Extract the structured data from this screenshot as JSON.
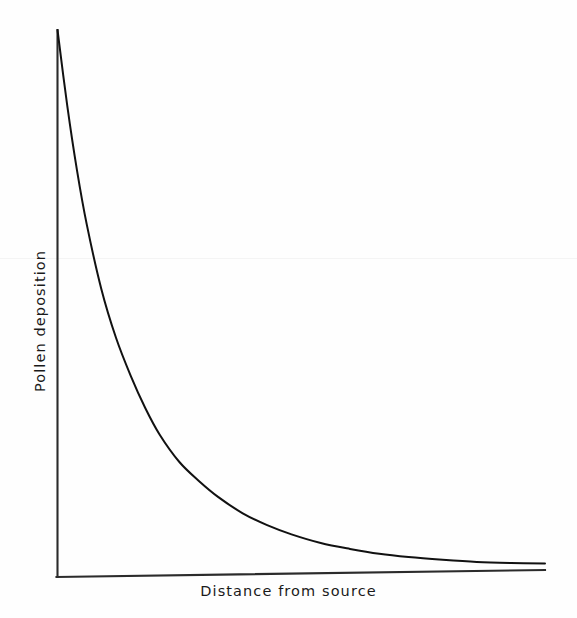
{
  "figure": {
    "background_color": "#fefefe",
    "line_color": "#111111",
    "axis_color": "#2b2b2b"
  },
  "labels": {
    "xlabel": "Distance from source",
    "ylabel": "Pollen deposition"
  },
  "chart_data": {
    "type": "line",
    "title": "",
    "subtitle": "",
    "xlabel": "Distance from source",
    "ylabel": "Pollen deposition",
    "legend": [],
    "legend_position": "none",
    "grid": false,
    "axis_ticks": {
      "x": [],
      "y": []
    },
    "xlim": [
      0,
      100
    ],
    "ylim": [
      0,
      100
    ],
    "series": [
      {
        "name": "Pollen deposition vs distance",
        "x": [
          0,
          2,
          4,
          6,
          9,
          12,
          15,
          18,
          21,
          25,
          29,
          33,
          38,
          43,
          48,
          54,
          60,
          66,
          72,
          79,
          86,
          93,
          100
        ],
        "y": [
          100,
          86,
          74,
          64,
          52,
          43,
          36,
          30,
          25,
          20,
          16.5,
          13.5,
          10.5,
          8.3,
          6.6,
          5.0,
          3.9,
          3.0,
          2.4,
          1.9,
          1.5,
          1.3,
          1.2
        ]
      }
    ]
  }
}
